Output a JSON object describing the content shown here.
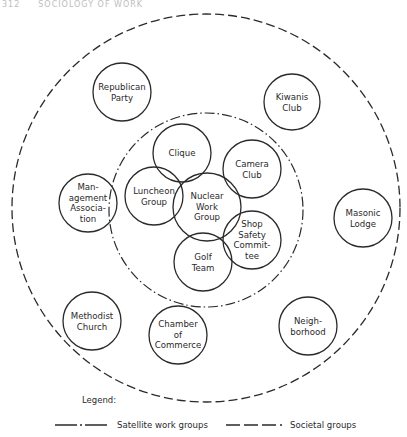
{
  "page_header": {
    "page_number": "312",
    "running_head": "SOCIOLOGY OF WORK"
  },
  "diagram": {
    "outer_boundary": {
      "label": "Societal groups",
      "style": "dashed",
      "cx": 206,
      "cy": 208,
      "r": 194
    },
    "inner_boundary": {
      "label": "Satellite work groups",
      "style": "dash-dot",
      "cx": 206,
      "cy": 210,
      "r": 97
    },
    "groups": [
      {
        "id": "republican-party",
        "label": "Republican\nParty",
        "ring": "societal",
        "cx": 122,
        "cy": 92,
        "r": 29
      },
      {
        "id": "kiwanis-club",
        "label": "Kiwanis\nClub",
        "ring": "societal",
        "cx": 292,
        "cy": 102,
        "r": 28
      },
      {
        "id": "management-association",
        "label": "Man-\nagement\nAssocia-\ntion",
        "ring": "societal",
        "cx": 88,
        "cy": 203,
        "r": 29
      },
      {
        "id": "masonic-lodge",
        "label": "Masonic\nLodge",
        "ring": "societal",
        "cx": 363,
        "cy": 218,
        "r": 29
      },
      {
        "id": "methodist-church",
        "label": "Methodist\nChurch",
        "ring": "societal",
        "cx": 92,
        "cy": 321,
        "r": 29
      },
      {
        "id": "chamber-of-commerce",
        "label": "Chamber\nof\nCommerce",
        "ring": "societal",
        "cx": 178,
        "cy": 335,
        "r": 29
      },
      {
        "id": "neighborhood",
        "label": "Neigh-\nborhood",
        "ring": "societal",
        "cx": 308,
        "cy": 326,
        "r": 29
      },
      {
        "id": "clique",
        "label": "Clique",
        "ring": "satellite",
        "cx": 182,
        "cy": 153,
        "r": 29
      },
      {
        "id": "camera-club",
        "label": "Camera\nClub",
        "ring": "satellite",
        "cx": 252,
        "cy": 169,
        "r": 29
      },
      {
        "id": "luncheon-group",
        "label": "Luncheon\nGroup",
        "ring": "satellite",
        "cx": 154,
        "cy": 196,
        "r": 29
      },
      {
        "id": "nuclear-work-group",
        "label": "Nuclear\nWork\nGroup",
        "ring": "core",
        "cx": 207,
        "cy": 207,
        "r": 34
      },
      {
        "id": "shop-safety-committee",
        "label": "Shop\nSafety\nCommit-\ntee",
        "ring": "satellite",
        "cx": 252,
        "cy": 240,
        "r": 29
      },
      {
        "id": "golf-team",
        "label": "Golf\nTeam",
        "ring": "satellite",
        "cx": 203,
        "cy": 262,
        "r": 29
      }
    ]
  },
  "legend": {
    "title": "Legend:",
    "items": [
      {
        "label": "Satellite work groups",
        "style": "dash-dot"
      },
      {
        "label": "Societal groups",
        "style": "dashed"
      }
    ]
  },
  "colors": {
    "stroke": "#2a2a2a",
    "background": "#ffffff"
  }
}
